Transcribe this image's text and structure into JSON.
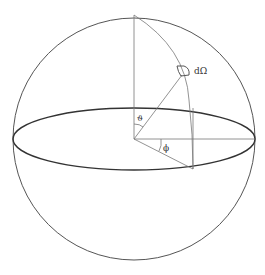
{
  "diagram": {
    "labels": {
      "solid_angle": "dΩ",
      "polar_angle": "ϑ",
      "azimuth_angle": "ϕ"
    },
    "elements": [
      "sphere",
      "equatorial-ellipse",
      "vertical-axis",
      "horizontal-radius",
      "azimuth-radius",
      "meridian-arc",
      "vertical-projection-line",
      "radius-to-patch",
      "surface-patch",
      "theta-arc",
      "phi-arc"
    ],
    "colors": {
      "line": "#555555",
      "background": "#ffffff"
    }
  }
}
